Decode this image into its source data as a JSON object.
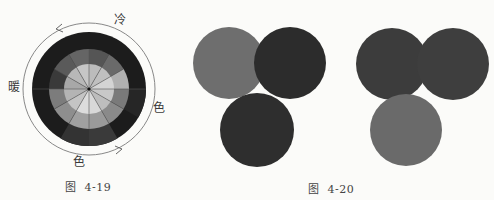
{
  "figure_4_19": {
    "labels": {
      "top": "冷",
      "left": "暖",
      "right": "色",
      "bottom": "色"
    },
    "caption": "图  4-19",
    "wheel": {
      "segments": 12,
      "rings": [
        "outer",
        "middle",
        "inner"
      ],
      "arrows": [
        "arrow-upper-left",
        "arrow-lower-right"
      ]
    }
  },
  "figure_4_20": {
    "caption": "图  4-20",
    "group_left": {
      "circles": [
        {
          "position": "top-left",
          "color": "#6e6e6e"
        },
        {
          "position": "top-right",
          "color": "#2c2c2c"
        },
        {
          "position": "bottom",
          "color": "#2e2e2e"
        }
      ]
    },
    "group_right": {
      "circles": [
        {
          "position": "top-left",
          "color": "#3c3c3c"
        },
        {
          "position": "top-right",
          "color": "#3e3e3e"
        },
        {
          "position": "bottom",
          "color": "#6a6a6a"
        }
      ]
    }
  }
}
